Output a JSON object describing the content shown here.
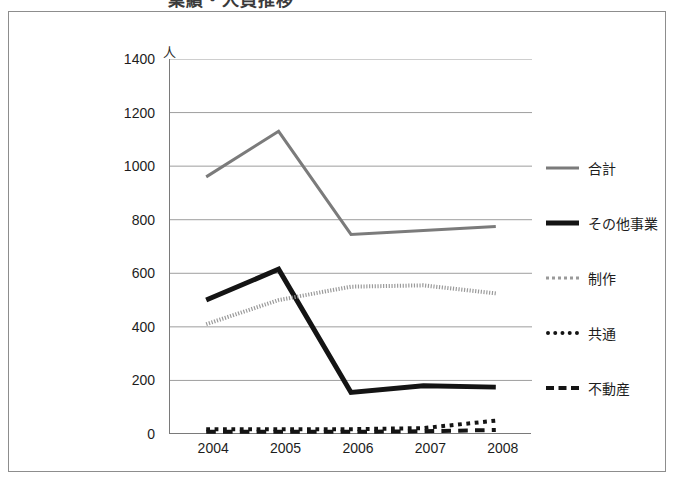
{
  "title": "業績・人員推移",
  "unit_label": "人",
  "chart_data": {
    "type": "line",
    "title": "業績・人員推移",
    "xlabel": "",
    "ylabel": "人",
    "ylim": [
      0,
      1400
    ],
    "ytick_step": 200,
    "yticks": [
      1400,
      1200,
      1000,
      800,
      600,
      400,
      200,
      0
    ],
    "categories": [
      "2004",
      "2005",
      "2006",
      "2007",
      "2008"
    ],
    "grid": true,
    "legend_position": "right",
    "series": [
      {
        "name": "合計",
        "values": [
          960,
          1130,
          745,
          760,
          775
        ],
        "color": "#7b7b7b",
        "style": "solid",
        "width": 3
      },
      {
        "name": "その他事業",
        "values": [
          500,
          615,
          155,
          180,
          175
        ],
        "color": "#141414",
        "style": "solid",
        "width": 5
      },
      {
        "name": "制作",
        "values": [
          410,
          500,
          550,
          555,
          525
        ],
        "color": "#9a9a9a",
        "style": "fine-dotted",
        "width": 4
      },
      {
        "name": "共通",
        "values": [
          18,
          18,
          18,
          22,
          50
        ],
        "color": "#141414",
        "style": "dotted",
        "width": 4
      },
      {
        "name": "不動産",
        "values": [
          8,
          8,
          8,
          10,
          15
        ],
        "color": "#141414",
        "style": "dashed",
        "width": 4
      }
    ]
  },
  "legend": {
    "items": [
      {
        "label": "合計",
        "swatch": "line-solid-gray"
      },
      {
        "label": "その他事業",
        "swatch": "line-solid-black-bold"
      },
      {
        "label": "制作",
        "swatch": "line-fine-dotted-gray"
      },
      {
        "label": "共通",
        "swatch": "line-dotted-black"
      },
      {
        "label": "不動産",
        "swatch": "line-dashed-black"
      }
    ]
  }
}
